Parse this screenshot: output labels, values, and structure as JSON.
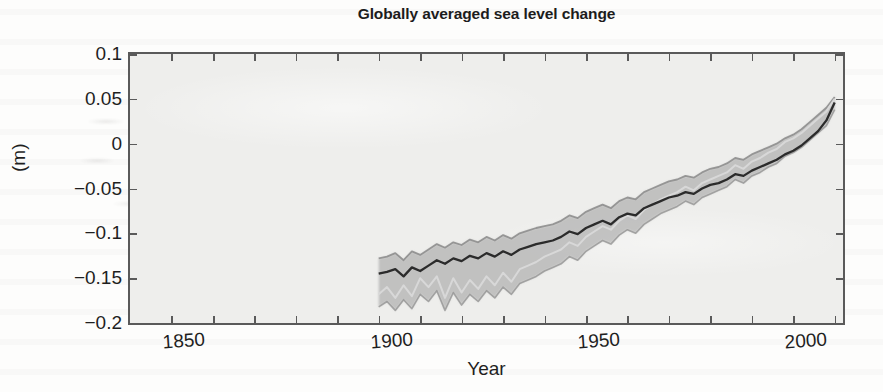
{
  "chart_data": {
    "type": "line",
    "title": "Globally averaged sea level change",
    "xlabel": "Year",
    "ylabel": "(m)",
    "xlim": [
      1840,
      2012
    ],
    "ylim": [
      -0.2,
      0.1
    ],
    "xticks": [
      1850,
      1900,
      1950,
      2000
    ],
    "xtick_labels": [
      "1850",
      "1900",
      "1950",
      "2000"
    ],
    "xtick_minor_step": 10,
    "yticks": [
      0.1,
      0.05,
      0,
      -0.05,
      -0.1,
      -0.15,
      -0.2
    ],
    "ytick_labels": [
      "0.1",
      "0.05",
      "0",
      "-0.05",
      "-0.1",
      "-0.15",
      "-0.2"
    ],
    "grid": false,
    "legend": "none",
    "units": "m",
    "note": "Multiple reconstruction series of globally averaged sea level change with shaded uncertainty bands; data begin near 1900 and end near 2010.",
    "colors": {
      "plot_background": "#eeeeec",
      "axis": "#5a5a5a",
      "text": "#1f1f1f",
      "series_dark": "#2b2b2b",
      "series_mid": "#8a8a8a",
      "series_light": "#d8d8d8",
      "band_fill": "#9a9a9a"
    },
    "x": [
      1900,
      1902,
      1904,
      1906,
      1908,
      1910,
      1912,
      1914,
      1916,
      1918,
      1920,
      1922,
      1924,
      1926,
      1928,
      1930,
      1932,
      1934,
      1936,
      1938,
      1940,
      1942,
      1944,
      1946,
      1948,
      1950,
      1952,
      1954,
      1956,
      1958,
      1960,
      1962,
      1964,
      1966,
      1968,
      1970,
      1972,
      1974,
      1976,
      1978,
      1980,
      1982,
      1984,
      1986,
      1988,
      1990,
      1992,
      1994,
      1996,
      1998,
      2000,
      2002,
      2004,
      2006,
      2008,
      2010
    ],
    "series": [
      {
        "name": "reconstruction-dark",
        "values": [
          -0.145,
          -0.143,
          -0.14,
          -0.148,
          -0.138,
          -0.142,
          -0.136,
          -0.13,
          -0.134,
          -0.128,
          -0.131,
          -0.125,
          -0.128,
          -0.122,
          -0.126,
          -0.12,
          -0.124,
          -0.118,
          -0.115,
          -0.112,
          -0.11,
          -0.108,
          -0.104,
          -0.098,
          -0.101,
          -0.094,
          -0.09,
          -0.086,
          -0.09,
          -0.082,
          -0.078,
          -0.08,
          -0.072,
          -0.068,
          -0.064,
          -0.06,
          -0.058,
          -0.054,
          -0.056,
          -0.05,
          -0.046,
          -0.044,
          -0.04,
          -0.034,
          -0.036,
          -0.03,
          -0.026,
          -0.022,
          -0.018,
          -0.012,
          -0.008,
          -0.002,
          0.006,
          0.014,
          0.026,
          0.046
        ]
      },
      {
        "name": "reconstruction-upper",
        "values": [
          -0.128,
          -0.126,
          -0.122,
          -0.13,
          -0.12,
          -0.124,
          -0.118,
          -0.112,
          -0.116,
          -0.11,
          -0.113,
          -0.107,
          -0.11,
          -0.104,
          -0.108,
          -0.102,
          -0.106,
          -0.1,
          -0.097,
          -0.094,
          -0.092,
          -0.09,
          -0.086,
          -0.08,
          -0.083,
          -0.076,
          -0.072,
          -0.068,
          -0.072,
          -0.064,
          -0.06,
          -0.062,
          -0.054,
          -0.05,
          -0.046,
          -0.042,
          -0.04,
          -0.036,
          -0.038,
          -0.032,
          -0.028,
          -0.026,
          -0.022,
          -0.016,
          -0.018,
          -0.012,
          -0.008,
          -0.004,
          0.0,
          0.006,
          0.01,
          0.016,
          0.024,
          0.032,
          0.04,
          0.052
        ]
      },
      {
        "name": "reconstruction-light",
        "values": [
          -0.168,
          -0.16,
          -0.172,
          -0.158,
          -0.17,
          -0.15,
          -0.16,
          -0.148,
          -0.172,
          -0.15,
          -0.166,
          -0.152,
          -0.162,
          -0.148,
          -0.158,
          -0.144,
          -0.154,
          -0.14,
          -0.136,
          -0.132,
          -0.126,
          -0.122,
          -0.118,
          -0.11,
          -0.114,
          -0.104,
          -0.098,
          -0.092,
          -0.096,
          -0.086,
          -0.08,
          -0.084,
          -0.074,
          -0.068,
          -0.062,
          -0.058,
          -0.054,
          -0.048,
          -0.052,
          -0.044,
          -0.04,
          -0.036,
          -0.032,
          -0.024,
          -0.028,
          -0.02,
          -0.016,
          -0.01,
          -0.006,
          0.002,
          0.006,
          0.012,
          0.02,
          0.028,
          0.036,
          0.05
        ]
      },
      {
        "name": "reconstruction-lower",
        "values": [
          -0.182,
          -0.176,
          -0.186,
          -0.174,
          -0.184,
          -0.168,
          -0.176,
          -0.164,
          -0.186,
          -0.166,
          -0.18,
          -0.168,
          -0.176,
          -0.164,
          -0.172,
          -0.16,
          -0.168,
          -0.156,
          -0.152,
          -0.148,
          -0.142,
          -0.138,
          -0.134,
          -0.126,
          -0.13,
          -0.12,
          -0.114,
          -0.108,
          -0.112,
          -0.102,
          -0.096,
          -0.1,
          -0.09,
          -0.084,
          -0.078,
          -0.074,
          -0.07,
          -0.064,
          -0.068,
          -0.06,
          -0.056,
          -0.052,
          -0.048,
          -0.04,
          -0.044,
          -0.036,
          -0.032,
          -0.026,
          -0.022,
          -0.014,
          -0.01,
          -0.004,
          0.004,
          0.012,
          0.02,
          0.038
        ]
      }
    ]
  }
}
